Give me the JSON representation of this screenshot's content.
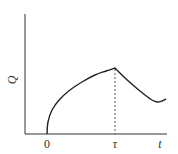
{
  "chart_data": {
    "type": "line",
    "title": "",
    "xlabel": "t",
    "ylabel": "Q",
    "x_ticks": [
      {
        "label": "0",
        "x": 47
      },
      {
        "label": "τ",
        "x": 115
      }
    ],
    "annotations": [
      {
        "type": "dashed-vertical-line",
        "at": "τ",
        "description": "drop line from peak of curve at t = τ to the time axis"
      }
    ],
    "series": [
      {
        "name": "Q(t)",
        "description": "Q is zero before t=0, rises concavely (square-root-like) from t=0 to a maximum at t=τ, then decays after τ to a shallow minimum and begins rising slightly",
        "points_px": [
          [
            47,
            134
          ],
          [
            48,
            122
          ],
          [
            52,
            110
          ],
          [
            60,
            99
          ],
          [
            70,
            90
          ],
          [
            82,
            82
          ],
          [
            95,
            75
          ],
          [
            106,
            71
          ],
          [
            115,
            68
          ],
          [
            124,
            77
          ],
          [
            134,
            86
          ],
          [
            145,
            95
          ],
          [
            152,
            100
          ],
          [
            157,
            102
          ],
          [
            162,
            101
          ],
          [
            166,
            99
          ]
        ]
      }
    ],
    "grid": false,
    "legend": null
  },
  "labels": {
    "y_axis": "Q",
    "x_axis": "t",
    "origin_tick": "0",
    "tau_tick": "τ"
  }
}
